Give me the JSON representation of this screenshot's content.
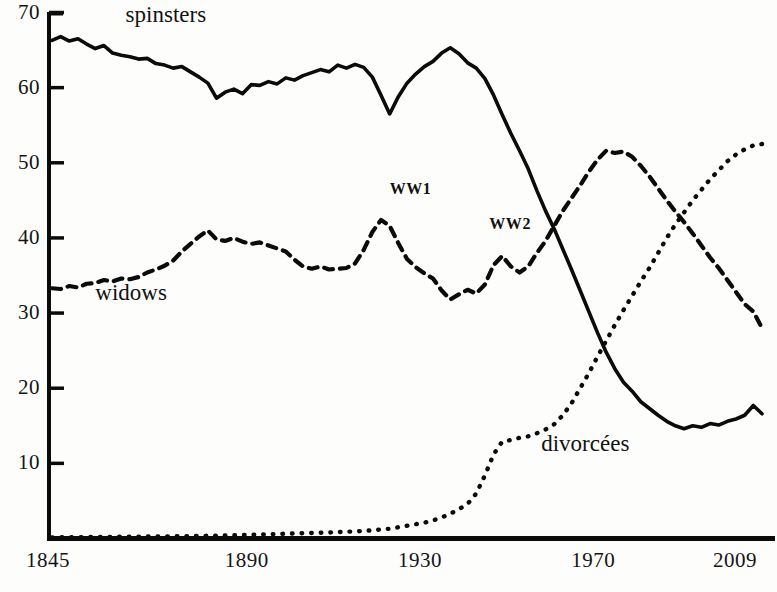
{
  "chart_data": {
    "type": "line",
    "title": "",
    "subtitle": "",
    "xlabel": "",
    "ylabel": "",
    "xlim": [
      1845,
      2009
    ],
    "ylim": [
      0,
      70
    ],
    "grid": false,
    "legend_position": "inline-annotations",
    "x_ticks": [
      "1845",
      "1890",
      "1930",
      "1970",
      "2009"
    ],
    "x_tick_values": [
      1845,
      1890,
      1930,
      1970,
      2009
    ],
    "y_ticks": [
      "10",
      "20",
      "30",
      "40",
      "50",
      "60",
      "70"
    ],
    "y_tick_values": [
      10,
      20,
      30,
      40,
      50,
      60,
      70
    ],
    "annotations": [
      {
        "text": "spinsters",
        "x": 1862,
        "y": 69.5,
        "style": "sl-big"
      },
      {
        "text": "widows",
        "x": 1855,
        "y": 32.5,
        "style": "sl-big"
      },
      {
        "text": "divorcées",
        "x": 1958,
        "y": 12.5,
        "style": "sl-big"
      },
      {
        "text": "WW1",
        "x": 1923,
        "y": 45.8,
        "style": "sl-ww"
      },
      {
        "text": "WW2",
        "x": 1946,
        "y": 41.2,
        "style": "sl-ww"
      }
    ],
    "series": [
      {
        "name": "spinsters",
        "style": "solid",
        "color": "#0b0b0b",
        "x": [
          1845,
          1847,
          1849,
          1851,
          1853,
          1855,
          1857,
          1859,
          1861,
          1863,
          1865,
          1867,
          1869,
          1871,
          1873,
          1875,
          1877,
          1879,
          1881,
          1883,
          1885,
          1887,
          1889,
          1891,
          1893,
          1895,
          1897,
          1899,
          1901,
          1903,
          1905,
          1907,
          1909,
          1911,
          1913,
          1915,
          1917,
          1919,
          1921,
          1923,
          1925,
          1927,
          1929,
          1931,
          1933,
          1935,
          1937,
          1939,
          1941,
          1943,
          1945,
          1947,
          1949,
          1951,
          1953,
          1955,
          1957,
          1959,
          1961,
          1963,
          1965,
          1967,
          1969,
          1971,
          1973,
          1975,
          1977,
          1979,
          1981,
          1983,
          1985,
          1987,
          1989,
          1991,
          1993,
          1995,
          1997,
          1999,
          2001,
          2003,
          2005,
          2007,
          2009
        ],
        "values": [
          66.3,
          66.8,
          66.2,
          66.5,
          65.8,
          65.2,
          65.6,
          64.6,
          64.3,
          64.1,
          63.8,
          63.9,
          63.2,
          63.0,
          62.6,
          62.8,
          62.1,
          61.4,
          60.6,
          58.6,
          59.4,
          59.8,
          59.2,
          60.4,
          60.3,
          60.8,
          60.5,
          61.3,
          61.0,
          61.6,
          62.0,
          62.4,
          62.1,
          63.0,
          62.6,
          63.1,
          62.7,
          61.4,
          59.0,
          56.5,
          58.8,
          60.6,
          61.8,
          62.8,
          63.5,
          64.6,
          65.3,
          64.5,
          63.3,
          62.6,
          61.2,
          59.0,
          56.4,
          53.9,
          51.6,
          49.2,
          46.3,
          43.6,
          41.2,
          38.5,
          35.8,
          33.0,
          30.2,
          27.4,
          24.8,
          22.6,
          20.8,
          19.6,
          18.2,
          17.3,
          16.4,
          15.6,
          15.0,
          14.6,
          15.0,
          14.8,
          15.3,
          15.1,
          15.6,
          15.9,
          16.4,
          17.7,
          16.6
        ]
      },
      {
        "name": "widows",
        "style": "dashed",
        "color": "#0b0b0b",
        "x": [
          1845,
          1847,
          1849,
          1851,
          1853,
          1855,
          1857,
          1859,
          1861,
          1863,
          1865,
          1867,
          1869,
          1871,
          1873,
          1875,
          1877,
          1879,
          1881,
          1883,
          1885,
          1887,
          1889,
          1891,
          1893,
          1895,
          1897,
          1899,
          1901,
          1903,
          1905,
          1907,
          1909,
          1911,
          1913,
          1915,
          1917,
          1919,
          1921,
          1923,
          1925,
          1927,
          1929,
          1931,
          1933,
          1935,
          1937,
          1939,
          1941,
          1943,
          1945,
          1947,
          1949,
          1951,
          1953,
          1955,
          1957,
          1959,
          1961,
          1963,
          1965,
          1967,
          1969,
          1971,
          1973,
          1975,
          1977,
          1979,
          1981,
          1983,
          1985,
          1987,
          1989,
          1991,
          1993,
          1995,
          1997,
          1999,
          2001,
          2003,
          2005,
          2007,
          2009
        ],
        "values": [
          33.3,
          33.2,
          33.6,
          33.4,
          33.9,
          34.0,
          34.4,
          34.2,
          34.6,
          34.5,
          34.8,
          35.4,
          35.8,
          36.3,
          37.0,
          38.2,
          39.2,
          40.2,
          41.0,
          39.8,
          39.6,
          40.0,
          39.5,
          39.2,
          39.4,
          39.0,
          38.6,
          38.2,
          37.1,
          36.2,
          35.9,
          36.2,
          35.8,
          35.9,
          36.0,
          36.6,
          38.4,
          40.8,
          42.4,
          41.6,
          39.3,
          37.2,
          36.1,
          35.3,
          34.6,
          33.0,
          31.8,
          32.5,
          33.1,
          32.6,
          33.8,
          36.4,
          37.6,
          36.2,
          35.4,
          36.2,
          38.0,
          39.6,
          41.6,
          43.6,
          45.3,
          47.0,
          48.8,
          50.4,
          51.6,
          51.3,
          51.5,
          50.8,
          49.6,
          48.2,
          46.6,
          45.0,
          43.5,
          42.1,
          40.6,
          39.0,
          37.4,
          36.0,
          34.4,
          32.8,
          31.2,
          30.2,
          28.0
        ]
      },
      {
        "name": "divorcées",
        "style": "dotted",
        "color": "#0b0b0b",
        "x": [
          1845,
          1855,
          1865,
          1875,
          1885,
          1891,
          1897,
          1903,
          1909,
          1913,
          1917,
          1919,
          1921,
          1923,
          1925,
          1927,
          1929,
          1931,
          1933,
          1935,
          1937,
          1939,
          1941,
          1943,
          1945,
          1947,
          1949,
          1951,
          1953,
          1955,
          1957,
          1959,
          1961,
          1963,
          1965,
          1967,
          1969,
          1971,
          1973,
          1975,
          1977,
          1979,
          1981,
          1983,
          1985,
          1987,
          1989,
          1991,
          1993,
          1995,
          1997,
          1999,
          2001,
          2003,
          2005,
          2007,
          2009
        ],
        "values": [
          0.15,
          0.2,
          0.25,
          0.3,
          0.4,
          0.5,
          0.6,
          0.7,
          0.8,
          0.9,
          1.0,
          1.1,
          1.2,
          1.3,
          1.5,
          1.7,
          1.9,
          2.1,
          2.4,
          2.8,
          3.3,
          3.9,
          4.6,
          6.0,
          8.4,
          11.2,
          12.9,
          13.1,
          13.4,
          13.6,
          14.0,
          14.5,
          15.2,
          16.4,
          18.0,
          20.0,
          22.0,
          24.2,
          26.3,
          28.4,
          30.4,
          32.3,
          34.2,
          36.0,
          38.0,
          40.0,
          41.8,
          43.4,
          45.0,
          46.4,
          47.8,
          49.0,
          50.2,
          51.1,
          51.8,
          52.3,
          52.5
        ]
      }
    ]
  }
}
